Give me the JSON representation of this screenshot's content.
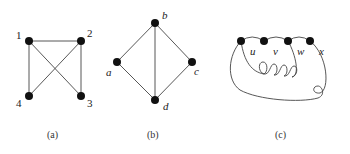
{
  "figure": {
    "graphs": [
      {
        "id": "a",
        "caption": "(a)",
        "nodes": [
          {
            "label": "1",
            "x": 29,
            "y": 41
          },
          {
            "label": "2",
            "x": 81,
            "y": 41
          },
          {
            "label": "3",
            "x": 81,
            "y": 96
          },
          {
            "label": "4",
            "x": 29,
            "y": 96
          }
        ],
        "edges": [
          [
            "1",
            "2"
          ],
          [
            "1",
            "4"
          ],
          [
            "2",
            "3"
          ],
          [
            "1",
            "3"
          ],
          [
            "2",
            "4"
          ]
        ]
      },
      {
        "id": "b",
        "caption": "(b)",
        "nodes": [
          {
            "label": "b",
            "x": 155,
            "y": 23
          },
          {
            "label": "a",
            "x": 117,
            "y": 62
          },
          {
            "label": "c",
            "x": 192,
            "y": 62
          },
          {
            "label": "d",
            "x": 155,
            "y": 100
          }
        ],
        "edges": [
          [
            "b",
            "a"
          ],
          [
            "b",
            "c"
          ],
          [
            "b",
            "d"
          ],
          [
            "a",
            "d"
          ],
          [
            "c",
            "d"
          ]
        ]
      },
      {
        "id": "c",
        "caption": "(c)",
        "nodes": [
          {
            "label": "",
            "x": 241,
            "y": 41
          },
          {
            "label": "",
            "x": 264,
            "y": 41
          },
          {
            "label": "",
            "x": 288,
            "y": 41
          },
          {
            "label": "",
            "x": 310,
            "y": 41
          }
        ],
        "edge_labels": [
          "u",
          "v",
          "w",
          "x"
        ]
      }
    ]
  }
}
